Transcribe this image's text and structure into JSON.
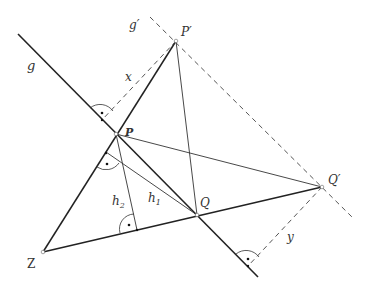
{
  "diagram": {
    "type": "geometry-construction",
    "labels": {
      "g": "g",
      "g_prime": "g′",
      "P": "P",
      "P_prime": "P′",
      "Q": "Q",
      "Q_prime": "Q′",
      "Z": "Z",
      "x": "x",
      "y": "y",
      "h1": "h",
      "h1_sub": "1",
      "h2": "h",
      "h2_sub": "2"
    },
    "points": {
      "Z": [
        43,
        252
      ],
      "P": [
        116,
        134
      ],
      "P_prime": [
        176,
        41
      ],
      "Q": [
        197,
        215
      ],
      "Q_prime": [
        322,
        187
      ]
    },
    "lines": [
      {
        "name": "g",
        "style": "solid-thick",
        "from": [
          18,
          34
        ],
        "to": [
          258,
          277
        ]
      },
      {
        "name": "g_prime",
        "style": "dashed",
        "from": [
          150,
          17
        ],
        "to": [
          354,
          219
        ]
      },
      {
        "name": "Z-P_prime",
        "style": "solid-thick",
        "from": "Z",
        "to": "P_prime"
      },
      {
        "name": "Z-Q_prime",
        "style": "solid-thick",
        "from": "Z",
        "to": "Q_prime"
      },
      {
        "name": "P-Q_prime",
        "style": "solid-thin",
        "from": "P",
        "to": "Q_prime"
      },
      {
        "name": "Q-P_prime",
        "style": "solid-thin",
        "from": "Q",
        "to": "P_prime"
      },
      {
        "name": "x",
        "style": "dashed",
        "from": "P_prime",
        "to": [
          102,
          120
        ]
      },
      {
        "name": "y",
        "style": "dashed",
        "from": "Q_prime",
        "to": [
          248,
          266
        ]
      },
      {
        "name": "h1",
        "style": "solid-thin",
        "from": "Q",
        "to": [
          106,
          152
        ]
      },
      {
        "name": "h2",
        "style": "solid-thin",
        "from": "P",
        "to": [
          137,
          230
        ]
      }
    ],
    "colors": {
      "line": "#222222",
      "dashed": "#555555",
      "text": "#333333"
    }
  }
}
